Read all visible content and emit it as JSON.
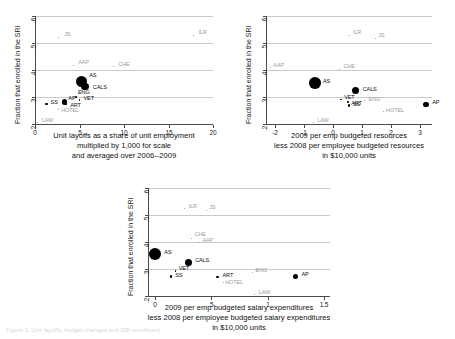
{
  "figure": {
    "caption": "Figure 1.  Unit layoffs, budget changes and SRI enrollment"
  },
  "chart_data": [
    {
      "id": "panel-top-left",
      "type": "scatter",
      "title": "",
      "ylabel": "Fraction that enrolled in the SRI",
      "xlabel": "Unit layoffs as a share of unit employment\nmultiplied by 1,000 for scale\nand averaged over 2006--2009",
      "xlabel_lines": [
        "Unit layoffs as a share of unit employment",
        "multiplied by 1,000 for scale",
        "and averaged over 2006--2009"
      ],
      "xlim": [
        0,
        20
      ],
      "ylim": [
        0.2,
        0.6
      ],
      "xticks": [
        0,
        5,
        10,
        15,
        20
      ],
      "xticklabels": [
        "0",
        "5",
        "10",
        "15",
        "20"
      ],
      "yticks": [
        0.2,
        0.3,
        0.4,
        0.5,
        0.6
      ],
      "yticklabels": [
        ".2",
        ".3",
        ".4",
        ".5",
        ".6"
      ],
      "grid": "horizontal",
      "points": [
        {
          "label": "JS",
          "x": 2.6,
          "y": 0.522,
          "size": 1.0,
          "faint": true,
          "lx": 6,
          "ly": -3
        },
        {
          "label": "ILR",
          "x": 17.8,
          "y": 0.528,
          "size": 1.0,
          "faint": true,
          "lx": 5,
          "ly": -3
        },
        {
          "label": "AAP",
          "x": 4.3,
          "y": 0.418,
          "size": 1.0,
          "faint": true,
          "lx": 5,
          "ly": -3
        },
        {
          "label": "CHE",
          "x": 8.8,
          "y": 0.412,
          "size": 1.0,
          "faint": true,
          "lx": 5,
          "ly": -3
        },
        {
          "label": "AS",
          "x": 5.2,
          "y": 0.358,
          "size": 11.5,
          "faint": false,
          "lx": 8,
          "ly": -6
        },
        {
          "label": "CALS",
          "x": 5.6,
          "y": 0.338,
          "size": 7.5,
          "faint": false,
          "lx": 8,
          "ly": 0
        },
        {
          "label": "ENG",
          "x": 4.6,
          "y": 0.299,
          "size": 1.8,
          "faint": false,
          "lx": 2,
          "ly": -5
        },
        {
          "label": "VET",
          "x": 5.0,
          "y": 0.289,
          "size": 1.4,
          "faint": false,
          "lx": 4,
          "ly": -2
        },
        {
          "label": "AP",
          "x": 3.3,
          "y": 0.282,
          "size": 5.5,
          "faint": false,
          "lx": 4,
          "ly": -4
        },
        {
          "label": "ART",
          "x": 3.5,
          "y": 0.272,
          "size": 1.6,
          "faint": false,
          "lx": 4,
          "ly": 0
        },
        {
          "label": "SS",
          "x": 1.3,
          "y": 0.273,
          "size": 2.2,
          "faint": false,
          "lx": 4,
          "ly": -2
        },
        {
          "label": "HOTEL",
          "x": 2.6,
          "y": 0.252,
          "size": 1.0,
          "faint": true,
          "lx": 3,
          "ly": 0
        },
        {
          "label": "LAW",
          "x": 0.3,
          "y": 0.206,
          "size": 1.0,
          "faint": true,
          "lx": 4,
          "ly": -2
        }
      ]
    },
    {
      "id": "panel-top-right",
      "type": "scatter",
      "title": "",
      "ylabel": "Fraction that enrolled in the SRI",
      "xlabel_lines": [
        "2009 per emp budgeted resources",
        "less 2008 per employee budgeted resources",
        "in $10,000 units"
      ],
      "xlim": [
        -2.3,
        3.4
      ],
      "ylim": [
        0.2,
        0.6
      ],
      "xticks": [
        -2,
        -1,
        0,
        1,
        2,
        3
      ],
      "xticklabels": [
        "-2",
        "-1",
        "0",
        "1",
        "2",
        "3"
      ],
      "yticks": [
        0.2,
        0.3,
        0.4,
        0.5,
        0.6
      ],
      "yticklabels": [
        ".2",
        ".3",
        ".4",
        ".5",
        ".6"
      ],
      "grid": "horizontal",
      "points": [
        {
          "label": "ILR",
          "x": 0.55,
          "y": 0.528,
          "size": 1.0,
          "faint": true,
          "lx": 4,
          "ly": -3
        },
        {
          "label": "JS",
          "x": 1.45,
          "y": 0.518,
          "size": 1.0,
          "faint": true,
          "lx": 3,
          "ly": -3
        },
        {
          "label": "AAP",
          "x": -2.15,
          "y": 0.408,
          "size": 1.0,
          "faint": true,
          "lx": 3,
          "ly": -3
        },
        {
          "label": "CHE",
          "x": 0.22,
          "y": 0.402,
          "size": 1.0,
          "faint": true,
          "lx": 4,
          "ly": -3
        },
        {
          "label": "AS",
          "x": -0.62,
          "y": 0.352,
          "size": 11.5,
          "faint": false,
          "lx": 8,
          "ly": -2
        },
        {
          "label": "CALS",
          "x": 0.78,
          "y": 0.323,
          "size": 7.0,
          "faint": false,
          "lx": 7,
          "ly": -2
        },
        {
          "label": "VET",
          "x": 0.28,
          "y": 0.29,
          "size": 1.4,
          "faint": false,
          "lx": 3,
          "ly": -3
        },
        {
          "label": "ENG",
          "x": 1.08,
          "y": 0.287,
          "size": 1.4,
          "faint": true,
          "lx": 4,
          "ly": -2
        },
        {
          "label": "ART",
          "x": 0.52,
          "y": 0.281,
          "size": 1.6,
          "faint": false,
          "lx": 3,
          "ly": 1
        },
        {
          "label": "SS",
          "x": 0.55,
          "y": 0.268,
          "size": 2.4,
          "faint": false,
          "lx": 4,
          "ly": -2
        },
        {
          "label": "AP",
          "x": 3.2,
          "y": 0.272,
          "size": 5.5,
          "faint": false,
          "lx": 6,
          "ly": -3
        },
        {
          "label": "HOTEL",
          "x": 1.72,
          "y": 0.246,
          "size": 1.0,
          "faint": true,
          "lx": 3,
          "ly": -2
        },
        {
          "label": "LAW",
          "x": -0.68,
          "y": 0.206,
          "size": 1.0,
          "faint": true,
          "lx": 4,
          "ly": -2
        }
      ]
    },
    {
      "id": "panel-bottom",
      "type": "scatter",
      "title": "",
      "ylabel": "Fraction that enrolled in the SRI",
      "xlabel_lines": [
        "2009 per emp budgeted salary expenditures",
        "less 2008 per employee budgeted salary expenditures",
        "in $10,000 units"
      ],
      "xlim": [
        -0.06,
        1.55
      ],
      "ylim": [
        0.2,
        0.6
      ],
      "xticks": [
        0,
        0.5,
        1,
        1.5
      ],
      "xticklabels": [
        "0",
        ".5",
        "1",
        "1.5"
      ],
      "yticks": [
        0.2,
        0.3,
        0.4,
        0.5,
        0.6
      ],
      "yticklabels": [
        ".2",
        ".3",
        ".4",
        ".5",
        ".6"
      ],
      "grid": "horizontal",
      "points": [
        {
          "label": "ILR",
          "x": 0.265,
          "y": 0.523,
          "size": 1.0,
          "faint": true,
          "lx": 4,
          "ly": -3
        },
        {
          "label": "JS",
          "x": 0.455,
          "y": 0.518,
          "size": 1.0,
          "faint": true,
          "lx": 3,
          "ly": -3
        },
        {
          "label": "CHE",
          "x": 0.325,
          "y": 0.413,
          "size": 1.0,
          "faint": true,
          "lx": 3,
          "ly": -4
        },
        {
          "label": "AAP",
          "x": 0.395,
          "y": 0.4,
          "size": 1.0,
          "faint": true,
          "lx": 3,
          "ly": -2
        },
        {
          "label": "AS",
          "x": 0.005,
          "y": 0.355,
          "size": 12.0,
          "faint": false,
          "lx": 9,
          "ly": -2
        },
        {
          "label": "CALS",
          "x": 0.295,
          "y": 0.325,
          "size": 7.0,
          "faint": false,
          "lx": 7,
          "ly": -2
        },
        {
          "label": "VET",
          "x": 0.185,
          "y": 0.292,
          "size": 1.4,
          "faint": false,
          "lx": 3,
          "ly": -3
        },
        {
          "label": "ENG",
          "x": 0.865,
          "y": 0.288,
          "size": 1.2,
          "faint": true,
          "lx": 3,
          "ly": -2
        },
        {
          "label": "SS",
          "x": 0.145,
          "y": 0.272,
          "size": 2.2,
          "faint": false,
          "lx": 4,
          "ly": -2
        },
        {
          "label": "ART",
          "x": 0.555,
          "y": 0.27,
          "size": 2.6,
          "faint": false,
          "lx": 5,
          "ly": -2
        },
        {
          "label": "AP",
          "x": 1.245,
          "y": 0.272,
          "size": 5.5,
          "faint": false,
          "lx": 6,
          "ly": -3
        },
        {
          "label": "HOTEL",
          "x": 0.605,
          "y": 0.249,
          "size": 1.0,
          "faint": true,
          "lx": 2,
          "ly": -1
        },
        {
          "label": "LAW",
          "x": 0.885,
          "y": 0.206,
          "size": 1.0,
          "faint": true,
          "lx": 4,
          "ly": -2
        }
      ]
    }
  ]
}
